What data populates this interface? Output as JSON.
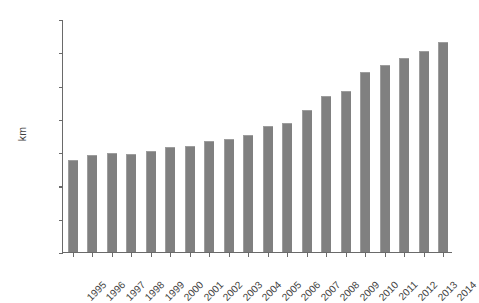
{
  "chart_data": {
    "type": "bar",
    "title": "",
    "xlabel": "",
    "ylabel": "km",
    "ylim": [
      0,
      14000
    ],
    "ytick_values": [
      0,
      2000,
      4000,
      6000,
      8000,
      10000,
      12000,
      14000
    ],
    "ytick_labels": [
      "0",
      "2000",
      "4000",
      "6000",
      "8000",
      "10000",
      "12000",
      "14000"
    ],
    "grid": false,
    "legend": null,
    "bar_color": "#808080",
    "axis_color": "#6a6a6a",
    "categories": [
      "1995",
      "1996",
      "1997",
      "1998",
      "1999",
      "2000",
      "2001",
      "2002",
      "2003",
      "2004",
      "2005",
      "2006",
      "2007",
      "2008",
      "2009",
      "2010",
      "2011",
      "2012",
      "2013",
      "2014"
    ],
    "values": [
      5550,
      5800,
      5950,
      5900,
      6050,
      6300,
      6400,
      6700,
      6800,
      7050,
      7550,
      7750,
      8550,
      9350,
      9650,
      10800,
      11250,
      11650,
      12050,
      12600
    ]
  },
  "figure": {
    "caption_fragment": ""
  }
}
